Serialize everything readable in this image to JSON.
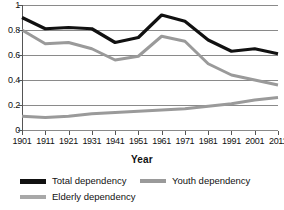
{
  "chart_data": {
    "type": "line",
    "title": "",
    "xlabel": "Year",
    "ylabel": "",
    "categories": [
      "1901",
      "1911",
      "1921",
      "1931",
      "1941",
      "1951",
      "1961",
      "1971",
      "1981",
      "1991",
      "2001",
      "2011"
    ],
    "x": [
      1901,
      1911,
      1921,
      1931,
      1941,
      1951,
      1961,
      1971,
      1981,
      1991,
      2001,
      2011
    ],
    "xlim": [
      1901,
      2011
    ],
    "ylim": [
      0,
      1
    ],
    "y_ticks": [
      0,
      0.2,
      0.4,
      0.6,
      0.8,
      1
    ],
    "y_tick_labels": [
      "0",
      "0.2",
      "0.4",
      "0.6",
      "0.8",
      "1"
    ],
    "grid": true,
    "grid_axis": "y",
    "legend_position": "bottom",
    "series": [
      {
        "name": "Total dependency",
        "color": "#111111",
        "width": 3.2,
        "values": [
          0.9,
          0.81,
          0.82,
          0.81,
          0.7,
          0.74,
          0.92,
          0.87,
          0.72,
          0.63,
          0.65,
          0.61
        ]
      },
      {
        "name": "Youth dependency",
        "color": "#9a9a9a",
        "width": 3.0,
        "values": [
          0.8,
          0.69,
          0.7,
          0.65,
          0.56,
          0.59,
          0.75,
          0.71,
          0.53,
          0.44,
          0.4,
          0.36
        ]
      },
      {
        "name": "Elderly dependency",
        "color": "#9a9a9a",
        "width": 3.0,
        "values": [
          0.11,
          0.1,
          0.11,
          0.13,
          0.14,
          0.15,
          0.16,
          0.17,
          0.19,
          0.21,
          0.24,
          0.26
        ]
      }
    ]
  },
  "axis": {
    "x_title": "Year"
  },
  "legend": {
    "items": [
      {
        "label": "Total dependency",
        "color": "#111111"
      },
      {
        "label": "Youth dependency",
        "color": "#9a9a9a"
      },
      {
        "label": "Elderly dependency",
        "color": "#a8a8a8"
      }
    ]
  }
}
